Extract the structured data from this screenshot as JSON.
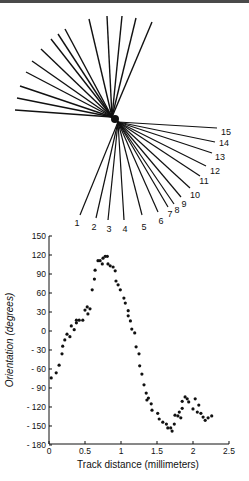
{
  "figure": {
    "fan_diagram": {
      "upper_center": [
        112,
        117
      ],
      "lower_center": [
        118,
        122
      ],
      "upper_lines": [
        [
          15,
          110
        ],
        [
          17,
          98
        ],
        [
          20,
          86
        ],
        [
          26,
          72
        ],
        [
          32,
          61
        ],
        [
          41,
          49
        ],
        [
          51,
          39
        ],
        [
          58,
          34
        ],
        [
          65,
          29
        ],
        [
          89,
          19
        ],
        [
          107,
          16
        ],
        [
          122,
          16
        ],
        [
          136,
          18
        ],
        [
          152,
          22
        ]
      ],
      "lower_lines": [
        {
          "label": "1",
          "end": [
            80,
            215
          ],
          "label_pos": [
            77,
            226
          ]
        },
        {
          "label": "2",
          "end": [
            96,
            218
          ],
          "label_pos": [
            94,
            230
          ]
        },
        {
          "label": "3",
          "end": [
            108,
            220
          ],
          "label_pos": [
            109,
            232
          ]
        },
        {
          "label": "4",
          "end": [
            124,
            220
          ],
          "label_pos": [
            125,
            232
          ]
        },
        {
          "label": "5",
          "end": [
            142,
            215
          ],
          "label_pos": [
            144,
            230
          ]
        },
        {
          "label": "6",
          "end": [
            158,
            212
          ],
          "label_pos": [
            161,
            224
          ]
        },
        {
          "label": "7",
          "end": [
            168,
            207
          ],
          "label_pos": [
            170,
            217
          ]
        },
        {
          "label": "8",
          "end": [
            174,
            204
          ],
          "label_pos": [
            177,
            213
          ]
        },
        {
          "label": "9",
          "end": [
            181,
            197
          ],
          "label_pos": [
            184,
            207
          ]
        },
        {
          "label": "10",
          "end": [
            190,
            188
          ],
          "label_pos": [
            195,
            198
          ]
        },
        {
          "label": "11",
          "end": [
            200,
            176
          ],
          "label_pos": [
            204,
            184
          ]
        },
        {
          "label": "12",
          "end": [
            206,
            166
          ],
          "label_pos": [
            215,
            174
          ]
        },
        {
          "label": "13",
          "end": [
            212,
            153
          ],
          "label_pos": [
            220,
            160
          ]
        },
        {
          "label": "14",
          "end": [
            215,
            142
          ],
          "label_pos": [
            224,
            146
          ]
        },
        {
          "label": "15",
          "end": [
            217,
            128
          ],
          "label_pos": [
            226,
            135
          ]
        }
      ]
    }
  },
  "chart_data": {
    "type": "scatter",
    "title": "",
    "xlabel": "Track distance (millimeters)",
    "ylabel": "Orientation (degrees)",
    "xlim": [
      0,
      2.5
    ],
    "ylim": [
      -180,
      150
    ],
    "x_ticks": [
      "0",
      "0.5",
      "1",
      "1.5",
      "2",
      "2.5"
    ],
    "y_ticks": [
      "150",
      "120",
      "90",
      "60",
      "30",
      "0",
      "-30",
      "-60",
      "-90",
      "-120",
      "-150",
      "-180"
    ],
    "grid": false,
    "legend": null,
    "points": [
      [
        0.03,
        -74
      ],
      [
        0.1,
        -66
      ],
      [
        0.14,
        -54
      ],
      [
        0.18,
        -36
      ],
      [
        0.19,
        -24
      ],
      [
        0.22,
        -14
      ],
      [
        0.25,
        -5
      ],
      [
        0.29,
        -9
      ],
      [
        0.31,
        8
      ],
      [
        0.35,
        2
      ],
      [
        0.38,
        13
      ],
      [
        0.38,
        17
      ],
      [
        0.42,
        17
      ],
      [
        0.47,
        17
      ],
      [
        0.5,
        33
      ],
      [
        0.53,
        38
      ],
      [
        0.54,
        27
      ],
      [
        0.57,
        35
      ],
      [
        0.6,
        65
      ],
      [
        0.63,
        82
      ],
      [
        0.64,
        96
      ],
      [
        0.68,
        111
      ],
      [
        0.71,
        111
      ],
      [
        0.74,
        106
      ],
      [
        0.75,
        115
      ],
      [
        0.78,
        118
      ],
      [
        0.81,
        118
      ],
      [
        0.82,
        106
      ],
      [
        0.85,
        103
      ],
      [
        0.89,
        101
      ],
      [
        0.92,
        95
      ],
      [
        0.93,
        79
      ],
      [
        0.96,
        73
      ],
      [
        0.99,
        65
      ],
      [
        1.04,
        52
      ],
      [
        1.06,
        44
      ],
      [
        1.1,
        32
      ],
      [
        1.1,
        24
      ],
      [
        1.13,
        16
      ],
      [
        1.15,
        3
      ],
      [
        1.19,
        -3
      ],
      [
        1.21,
        -25
      ],
      [
        1.25,
        -36
      ],
      [
        1.26,
        -55
      ],
      [
        1.29,
        -68
      ],
      [
        1.32,
        -85
      ],
      [
        1.35,
        -98
      ],
      [
        1.36,
        -109
      ],
      [
        1.38,
        -106
      ],
      [
        1.42,
        -115
      ],
      [
        1.43,
        -125
      ],
      [
        1.51,
        -130
      ],
      [
        1.53,
        -139
      ],
      [
        1.58,
        -144
      ],
      [
        1.63,
        -147
      ],
      [
        1.65,
        -153
      ],
      [
        1.69,
        -153
      ],
      [
        1.71,
        -158
      ],
      [
        1.74,
        -147
      ],
      [
        1.75,
        -133
      ],
      [
        1.79,
        -134
      ],
      [
        1.81,
        -128
      ],
      [
        1.83,
        -137
      ],
      [
        1.85,
        -122
      ],
      [
        1.85,
        -111
      ],
      [
        1.89,
        -104
      ],
      [
        1.92,
        -107
      ],
      [
        1.94,
        -112
      ],
      [
        2.0,
        -123
      ],
      [
        2.03,
        -107
      ],
      [
        2.06,
        -128
      ],
      [
        2.08,
        -117
      ],
      [
        2.11,
        -130
      ],
      [
        2.14,
        -136
      ],
      [
        2.17,
        -141
      ],
      [
        2.21,
        -137
      ],
      [
        2.26,
        -134
      ]
    ]
  },
  "plot_layout": {
    "x0_px": 49,
    "px_per_mm": 72,
    "y0_px": 331,
    "px_per_deg": 0.6333,
    "axis_top_px": 236,
    "axis_bottom_px": 444,
    "axis_right_px": 229
  }
}
